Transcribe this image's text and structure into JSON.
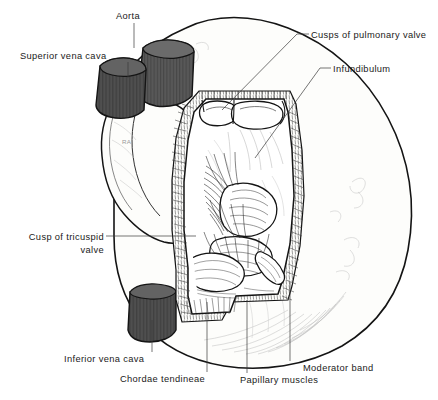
{
  "figure": {
    "type": "anatomical-line-drawing",
    "background_color": "#ffffff",
    "ink_color": "#1a1a1a",
    "vessel_fill_color": "#555555",
    "myocardium_fill_color": "#fbfbf9",
    "label_color": "#1a1a1a",
    "faint_label_color": "#9a9a9a"
  },
  "labels": {
    "aorta": "Aorta",
    "superior_vena_cava": "Superior vena cava",
    "cusps_of_pulmonary_valve": "Cusps of pulmonary valve",
    "infundibulum": "Infundibulum",
    "cusp_of_tricuspid_valve": "Cusp of tricuspid valve",
    "inferior_vena_cava": "Inferior vena cava",
    "chordae_tendineae": "Chordae tendineae",
    "papillary_muscles": "Papillary muscles",
    "moderator_band": "Moderator band",
    "right_atrium_abbrev": "RA"
  }
}
